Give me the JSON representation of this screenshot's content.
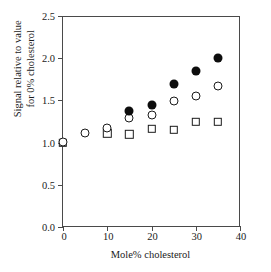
{
  "chart_data": {
    "type": "scatter",
    "title": "",
    "xlabel": "Mole% cholesterol",
    "ylabel_line1": "Signal relative to value",
    "ylabel_line2": "for 0% cholesterol",
    "xlim": [
      0,
      40
    ],
    "ylim": [
      0.0,
      2.5
    ],
    "xticks": [
      "0",
      "10",
      "20",
      "30",
      "40"
    ],
    "xtick_values": [
      0,
      10,
      20,
      30,
      40
    ],
    "yticks": [
      "0.0",
      "0.5",
      "1.0",
      "1.5",
      "2.0",
      "2.5"
    ],
    "ytick_values": [
      0.0,
      0.5,
      1.0,
      1.5,
      2.0,
      2.5
    ],
    "grid": false,
    "legend": "none",
    "series": [
      {
        "name": "filled circle",
        "marker": "filled-circle",
        "color": "#0d0d0d",
        "x": [
          15,
          20,
          25,
          30,
          35
        ],
        "values": [
          1.37,
          1.44,
          1.7,
          1.85,
          2.0
        ]
      },
      {
        "name": "open circle",
        "marker": "open-circle",
        "color": "#1a1a1a",
        "x": [
          0,
          5,
          10,
          15,
          20,
          25,
          30,
          35
        ],
        "values": [
          1.01,
          1.11,
          1.17,
          1.29,
          1.33,
          1.49,
          1.55,
          1.67
        ]
      },
      {
        "name": "open square",
        "marker": "open-square",
        "color": "#1a1a1a",
        "x": [
          0,
          10,
          15,
          20,
          25,
          30,
          35
        ],
        "values": [
          1.0,
          1.11,
          1.1,
          1.16,
          1.15,
          1.25,
          1.25
        ]
      }
    ]
  }
}
